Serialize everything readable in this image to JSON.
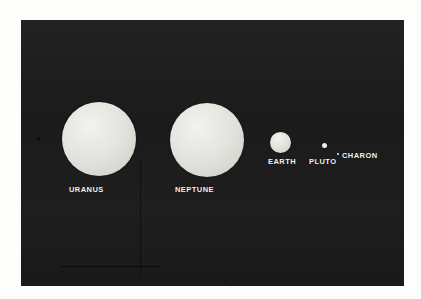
{
  "figure": {
    "kind": "photographic-plate",
    "background_color": "#1c1c1c",
    "page_color": "#fdfdfc",
    "disc_color": "#e2e2dd",
    "label_color": "#f4f4f0"
  },
  "bodies": [
    {
      "id": "uranus",
      "label": "URANUS",
      "shape": "disc",
      "relative_diameter_px": 74,
      "center_x_px": 78,
      "center_y_px": 119
    },
    {
      "id": "neptune",
      "label": "NEPTUNE",
      "shape": "disc",
      "relative_diameter_px": 74,
      "center_x_px": 186,
      "center_y_px": 120
    },
    {
      "id": "earth",
      "label": "EARTH",
      "shape": "disc",
      "relative_diameter_px": 21,
      "center_x_px": 259,
      "center_y_px": 122
    },
    {
      "id": "pluto",
      "label": "PLUTO",
      "shape": "dot",
      "relative_diameter_px": 5,
      "center_x_px": 303,
      "center_y_px": 125
    },
    {
      "id": "charon",
      "label": "CHARON",
      "shape": "dot",
      "relative_diameter_px": 2,
      "center_x_px": 317,
      "center_y_px": 134
    }
  ],
  "artifacts": {
    "vertical_scan_line": "faint dark vertical streak below Uranus",
    "horizontal_scan_line": "faint dark horizontal streak near bottom left",
    "speck": "small dark speck at left of Uranus"
  }
}
